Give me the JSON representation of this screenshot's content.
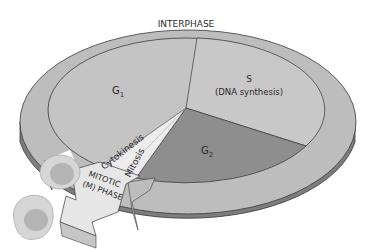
{
  "diagram": {
    "outer_ring_label": "INTERPHASE",
    "phases": [
      {
        "id": "g1",
        "label": "G",
        "subscript": "1",
        "color": "#c4c4c4"
      },
      {
        "id": "s",
        "label": "S",
        "sublabel": "(DNA synthesis)",
        "color": "#c8c8c8"
      },
      {
        "id": "g2",
        "label": "G",
        "subscript": "2",
        "color": "#8e8e8e"
      }
    ],
    "mitotic": {
      "cytokinesis_label": "Cytokinesis",
      "mitosis_label": "Mitosis",
      "arrow_label_line1": "MITOTIC",
      "arrow_label_line2": "(M) PHASE",
      "color": "#e6e6e6"
    },
    "colors": {
      "ring_top": "#bdbdbd",
      "ring_side": "#7d7d7d",
      "outline": "#3a3a3a",
      "cell": "#d6d6d6",
      "nucleus": "#b4b4b4"
    }
  }
}
